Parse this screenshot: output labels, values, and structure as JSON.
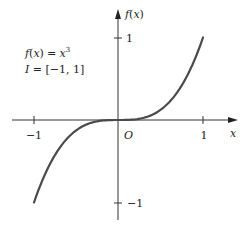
{
  "chart_data": {
    "type": "line",
    "title": "",
    "function_label": "f(x) = x³",
    "interval_label": "I = [−1, 1]",
    "xlabel": "x",
    "ylabel": "f(x)",
    "origin_label": "O",
    "xlim": [
      -1,
      1
    ],
    "ylim": [
      -1,
      1
    ],
    "x_ticks": [
      -1,
      1
    ],
    "x_tick_labels": [
      "−1",
      "1"
    ],
    "y_ticks": [
      1,
      -1
    ],
    "y_tick_labels": [
      "1",
      "−1"
    ],
    "grid": false,
    "legend": "none",
    "series": [
      {
        "name": "f(x) = x^3",
        "x": [
          -1,
          -0.75,
          -0.5,
          -0.25,
          0,
          0.25,
          0.5,
          0.75,
          1
        ],
        "y": [
          -1,
          -0.421875,
          -0.125,
          -0.015625,
          0,
          0.015625,
          0.125,
          0.421875,
          1
        ]
      }
    ],
    "colors": {
      "curve": "#4a4a4a",
      "axes": "#333333",
      "text": "#222222"
    }
  },
  "labels": {
    "fx_f": "f",
    "fx_paren_open": "(",
    "fx_x": "x",
    "fx_paren_close": ")",
    "eq_rhs": "= ",
    "cube_base": "x",
    "cube_exp": "3",
    "interval_I": "I",
    "interval_rest": " = [−1, 1]",
    "axis_y_f": "f",
    "axis_y_rest_open": "(",
    "axis_y_x": "x",
    "axis_y_rest_close": ")",
    "axis_x": "x",
    "origin": "O",
    "tick_x_neg1": "−1",
    "tick_x_pos1": "1",
    "tick_y_pos1": "1",
    "tick_y_neg1": "−1"
  }
}
